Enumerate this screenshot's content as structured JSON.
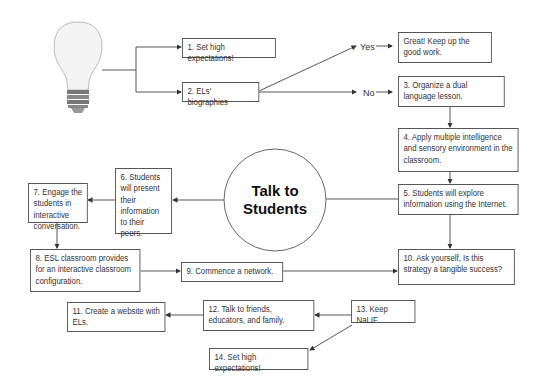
{
  "diagram": {
    "center": "Talk to Students",
    "center_lines": [
      "Talk to",
      "Students"
    ],
    "branches": {
      "yes": "Yes",
      "no": "No"
    },
    "nodes": [
      {
        "id": "n1",
        "text": "1. Set high expectations!"
      },
      {
        "id": "n2",
        "text": "2. ELs' biographies"
      },
      {
        "id": "great",
        "text": "Great! Keep up the good work."
      },
      {
        "id": "n3",
        "text": "3. Organize a dual language lesson."
      },
      {
        "id": "n4",
        "text": "4. Apply multiple intelligence and sensory environment in the classroom."
      },
      {
        "id": "n5",
        "text": "5. Students will explore information using the Internet."
      },
      {
        "id": "n6",
        "text": "6. Students will present their information to their peers."
      },
      {
        "id": "n7",
        "text": "7. Engage the students in interactive conversation."
      },
      {
        "id": "n8",
        "text": "8. ESL classroom provides for an interactive classroom configuration."
      },
      {
        "id": "n9",
        "text": "9. Commence a network."
      },
      {
        "id": "n10",
        "text": "10. Ask yourself, Is this strategy a tangible success?"
      },
      {
        "id": "n11",
        "text": "11. Create a website with ELs."
      },
      {
        "id": "n12",
        "text": "12. Talk to friends, educators, and family."
      },
      {
        "id": "n13",
        "text": "13. Keep NaLIF."
      },
      {
        "id": "n14",
        "text": "14. Set high expectations!"
      }
    ],
    "icon": "light-bulb-icon",
    "colors": {
      "line": "#444444",
      "border": "#555555",
      "text": "#333333"
    }
  }
}
